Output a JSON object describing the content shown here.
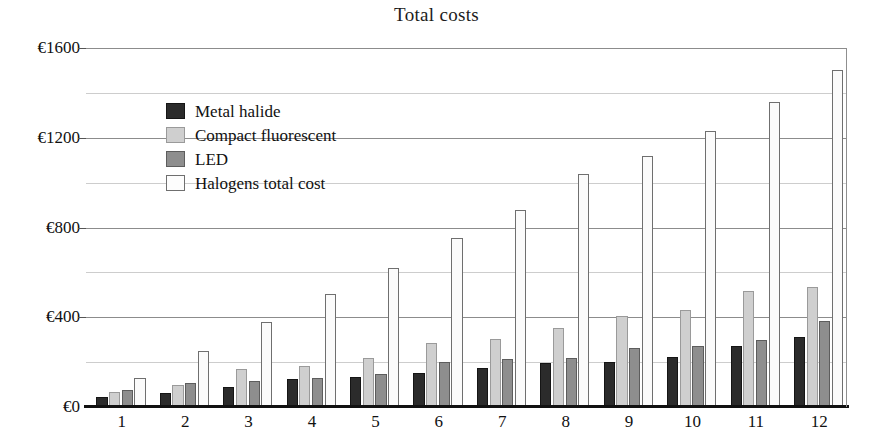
{
  "chart_data": {
    "type": "bar",
    "title": "Total costs",
    "xlabel": "",
    "ylabel": "",
    "ylim": [
      0,
      1600
    ],
    "yticks": [
      0,
      400,
      800,
      1200,
      1600
    ],
    "ytick_labels": [
      "€0",
      "€400",
      "€800",
      "€1200",
      "€1600"
    ],
    "minor_gridlines": [
      200,
      600,
      1000,
      1400
    ],
    "grid": true,
    "legend_position": "upper-left-inside",
    "categories": [
      "1",
      "2",
      "3",
      "4",
      "5",
      "6",
      "7",
      "8",
      "9",
      "10",
      "11",
      "12"
    ],
    "series": [
      {
        "name": "Metal halide",
        "color": "#2b2b2b",
        "values": [
          45,
          63,
          90,
          126,
          135,
          152,
          172,
          198,
          200,
          225,
          272,
          310
        ]
      },
      {
        "name": "Compact fluorescent",
        "color": "#cfcfcf",
        "values": [
          67,
          100,
          170,
          184,
          220,
          287,
          305,
          350,
          405,
          432,
          518,
          535
        ]
      },
      {
        "name": "LED",
        "color": "#8e8e8e",
        "values": [
          76,
          108,
          117,
          130,
          148,
          202,
          212,
          220,
          265,
          274,
          300,
          382
        ]
      },
      {
        "name": "Halogens total cost",
        "color": "#fbfbfb",
        "values": [
          130,
          251,
          377,
          502,
          618,
          753,
          880,
          1040,
          1120,
          1232,
          1360,
          1500
        ]
      }
    ]
  },
  "legend": {
    "items": [
      {
        "label": "Metal halide",
        "swatch": "sw-metal"
      },
      {
        "label": "Compact fluorescent",
        "swatch": "sw-cfl"
      },
      {
        "label": "LED",
        "swatch": "sw-led"
      },
      {
        "label": "Halogens total cost",
        "swatch": "sw-halogen"
      }
    ]
  }
}
